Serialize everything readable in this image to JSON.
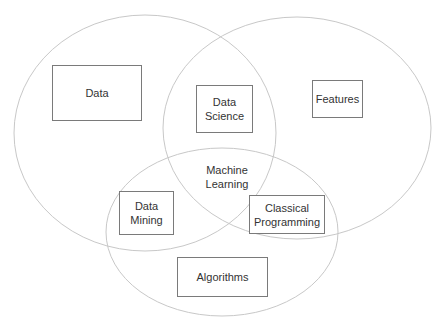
{
  "diagram": {
    "type": "venn",
    "circles": [
      {
        "name": "left",
        "cx": 145,
        "cy": 133,
        "rx": 131,
        "ry": 118
      },
      {
        "name": "right",
        "cx": 297,
        "cy": 128,
        "rx": 134,
        "ry": 111
      },
      {
        "name": "bottom",
        "cx": 222,
        "cy": 232,
        "rx": 116,
        "ry": 84
      }
    ],
    "stroke_color": "#c8c8c8",
    "labels": {
      "data": "Data",
      "data_science_1": "Data",
      "data_science_2": "Science",
      "features": "Features",
      "machine_learning_1": "Machine",
      "machine_learning_2": "Learning",
      "data_mining_1": "Data",
      "data_mining_2": "Mining",
      "classical_1": "Classical",
      "classical_2": "Programming",
      "algorithms": "Algorithms"
    }
  }
}
